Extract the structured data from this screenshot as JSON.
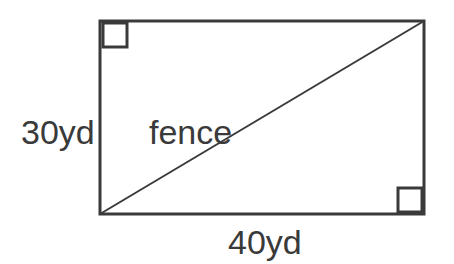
{
  "figure": {
    "background_color": "#ffffff",
    "stroke_color": "#3a3a3a",
    "text_color": "#3a3a3a",
    "rectangle": {
      "name": "field-rectangle",
      "left": 100,
      "top": 21,
      "right": 424,
      "bottom": 214,
      "width": 324,
      "height": 193,
      "stroke_width": 3
    },
    "diagonal": {
      "name": "fence-diagonal",
      "x1": 100,
      "y1": 214,
      "x2": 424,
      "y2": 21,
      "stroke_width": 2
    },
    "right_angle_markers": [
      {
        "name": "right-angle-top-left",
        "corner": "top-left",
        "x": 103,
        "y": 23,
        "size": 24,
        "stroke_width": 3
      },
      {
        "name": "right-angle-bottom-right",
        "corner": "bottom-right",
        "x": 398,
        "y": 188,
        "size": 24,
        "stroke_width": 3
      }
    ]
  },
  "labels": {
    "height": "30yd",
    "base": "40yd",
    "diagonal": "fence"
  },
  "chart_data": {
    "type": "diagram",
    "shape": "rectangle",
    "annotations": [
      {
        "label": "30yd",
        "side": "left",
        "value": 30,
        "unit": "yd"
      },
      {
        "label": "40yd",
        "side": "bottom",
        "value": 40,
        "unit": "yd"
      },
      {
        "label": "fence",
        "side": "diagonal",
        "value": null,
        "unit": null
      }
    ],
    "right_angles": [
      "top-left",
      "bottom-right"
    ]
  }
}
